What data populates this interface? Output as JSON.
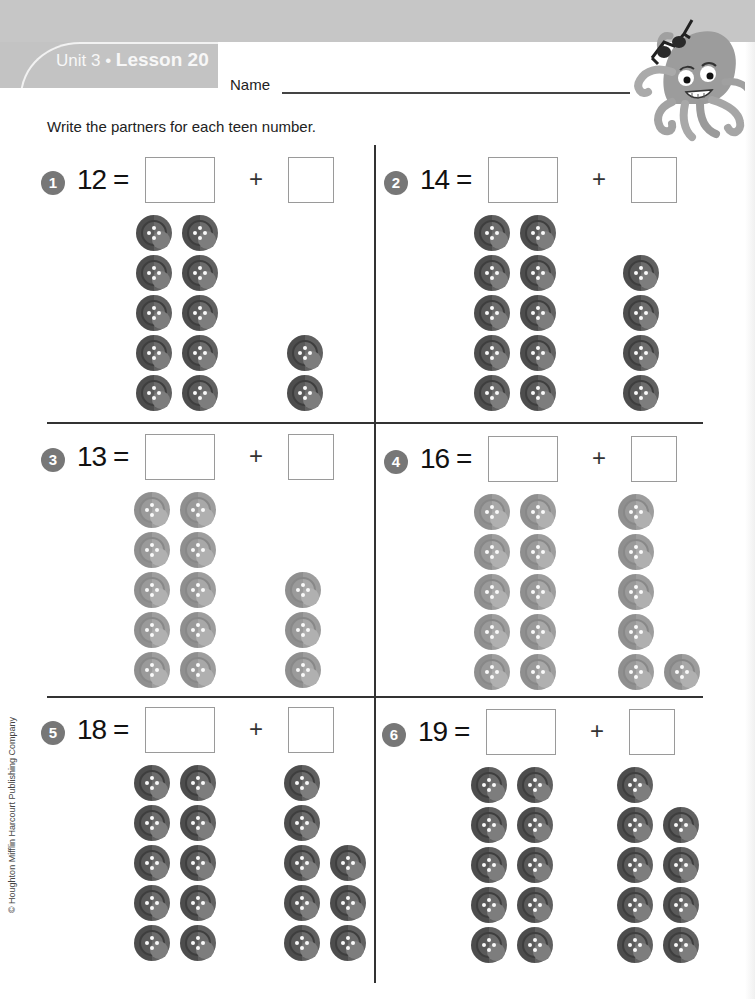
{
  "header": {
    "unit_label": "Unit 3 • ",
    "lesson_label": "Lesson 20",
    "name_label": "Name"
  },
  "mascot": {
    "icon": "octopus-with-sunglasses-icon"
  },
  "instructions": "Write the partners for each teen number.",
  "copyright": "© Houghton Mifflin Harcourt Publishing Company",
  "colors": {
    "header_band": "#c6c6c6",
    "lesson_tab": "#c3c3c3",
    "number_badge": "#777777",
    "button_dark": "#555555",
    "button_light": "#979797",
    "divider": "#333333"
  },
  "problems": [
    {
      "number": "1",
      "total": "12",
      "equals": "=",
      "plus": "+",
      "left_box": "",
      "right_box": "",
      "tens_count": 10,
      "ones_count": 2,
      "ones_layout": [
        [
          0,
          3
        ],
        [
          0,
          4
        ]
      ],
      "shade": "dark"
    },
    {
      "number": "2",
      "total": "14",
      "equals": "=",
      "plus": "+",
      "left_box": "",
      "right_box": "",
      "tens_count": 10,
      "ones_count": 4,
      "ones_layout": [
        [
          0,
          1
        ],
        [
          0,
          2
        ],
        [
          0,
          3
        ],
        [
          0,
          4
        ]
      ],
      "shade": "dark"
    },
    {
      "number": "3",
      "total": "13",
      "equals": "=",
      "plus": "+",
      "left_box": "",
      "right_box": "",
      "tens_count": 10,
      "ones_count": 3,
      "ones_layout": [
        [
          0,
          2
        ],
        [
          0,
          3
        ],
        [
          0,
          4
        ]
      ],
      "shade": "light"
    },
    {
      "number": "4",
      "total": "16",
      "equals": "=",
      "plus": "+",
      "left_box": "",
      "right_box": "",
      "tens_count": 10,
      "ones_count": 6,
      "ones_layout": [
        [
          0,
          0
        ],
        [
          0,
          1
        ],
        [
          0,
          2
        ],
        [
          0,
          3
        ],
        [
          0,
          4
        ],
        [
          1,
          4
        ]
      ],
      "shade": "light"
    },
    {
      "number": "5",
      "total": "18",
      "equals": "=",
      "plus": "+",
      "left_box": "",
      "right_box": "",
      "tens_count": 10,
      "ones_count": 8,
      "ones_layout": [
        [
          0,
          0
        ],
        [
          0,
          1
        ],
        [
          0,
          2
        ],
        [
          1,
          2
        ],
        [
          0,
          3
        ],
        [
          1,
          3
        ],
        [
          0,
          4
        ],
        [
          1,
          4
        ]
      ],
      "shade": "dark"
    },
    {
      "number": "6",
      "total": "19",
      "equals": "=",
      "plus": "+",
      "left_box": "",
      "right_box": "",
      "tens_count": 10,
      "ones_count": 9,
      "ones_layout": [
        [
          0,
          0
        ],
        [
          0,
          1
        ],
        [
          1,
          1
        ],
        [
          0,
          2
        ],
        [
          1,
          2
        ],
        [
          0,
          3
        ],
        [
          1,
          3
        ],
        [
          0,
          4
        ],
        [
          1,
          4
        ]
      ],
      "shade": "dark"
    }
  ]
}
